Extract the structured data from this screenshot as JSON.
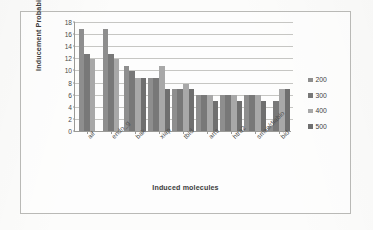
{
  "chart_data": {
    "type": "bar",
    "title": "",
    "xlabel": "Induced molecules",
    "ylabel": "Inducement Probability",
    "ylim": [
      0,
      18
    ],
    "ytick_step": 2,
    "yticks": [
      18,
      16,
      14,
      12,
      10,
      8,
      6,
      4,
      2,
      0
    ],
    "grid": true,
    "legend_position": "right",
    "categories": [
      "aif",
      "endo_g",
      "bak",
      "xiap",
      "tbid",
      "arts",
      "htra2",
      "smac/diablo",
      "bid"
    ],
    "series": [
      {
        "name": "200",
        "color": "#8e8e8e",
        "values": [
          16.9,
          16.9,
          10.8,
          8.8,
          6.9,
          5.9,
          5.9,
          5.9,
          0.8
        ]
      },
      {
        "name": "300",
        "color": "#787878",
        "values": [
          12.8,
          12.8,
          9.9,
          8.8,
          6.9,
          5.9,
          5.9,
          5.9,
          4.9
        ]
      },
      {
        "name": "400",
        "color": "#a8a8a8",
        "values": [
          11.9,
          11.9,
          8.8,
          10.8,
          7.8,
          5.9,
          5.9,
          5.9,
          6.9
        ]
      },
      {
        "name": "500",
        "color": "#6f6f6f",
        "values": [
          11.9,
          11.9,
          8.8,
          6.9,
          6.9,
          4.9,
          4.9,
          4.9,
          6.9
        ]
      }
    ],
    "series_visible_per_group": [
      3,
      3,
      4,
      4,
      4,
      4,
      4,
      4,
      4
    ]
  },
  "legend": {
    "items": [
      {
        "label": "200",
        "color": "#8e8e8e"
      },
      {
        "label": "300",
        "color": "#787878"
      },
      {
        "label": "400",
        "color": "#a8a8a8"
      },
      {
        "label": "500",
        "color": "#6f6f6f"
      }
    ]
  }
}
